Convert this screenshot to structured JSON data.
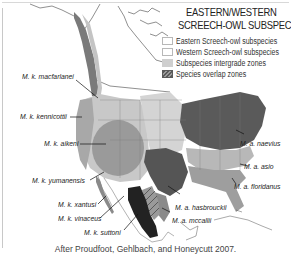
{
  "legend": {
    "title_line1": "EASTERN/WESTERN",
    "title_line2": "SCREECH-OWL SUBSPECIES",
    "items": [
      {
        "label": "Eastern Screech-owl subspecies",
        "type": "eastern"
      },
      {
        "label": "Western Screech-owl subspecies",
        "type": "western"
      },
      {
        "label": "Subspecies intergrade zones",
        "type": "intergrade"
      },
      {
        "label": "Species overlap zones",
        "type": "overlap"
      }
    ]
  },
  "western_labels": [
    {
      "text": "M. k. macfarlanei"
    },
    {
      "text": "M. k. kennicottii"
    },
    {
      "text": "M. k. aikeni"
    },
    {
      "text": "M. k. yumanensis"
    },
    {
      "text": "M. k. xantusi"
    },
    {
      "text": "M. k. vinaceus"
    },
    {
      "text": "M. k. suttoni"
    }
  ],
  "eastern_labels": [
    {
      "text": "M. a. naevius"
    },
    {
      "text": "M. a. asio"
    },
    {
      "text": "M. a. floridanus"
    },
    {
      "text": "M. a. hasbrouckii"
    },
    {
      "text": "M. a. mccallii"
    }
  ],
  "caption": "After Proudfoot, Gehlbach, and Honeycutt 2007.",
  "colors": {
    "kennicottii": "#a8a8a8",
    "macfarlanei": "#7a7a7a",
    "aikeni": "#9a9a9a",
    "intergrade": "#d4d4d4",
    "naevius": "#5a5a5a",
    "asio": "#b8b8b8",
    "floridanus": "#9e9e9e",
    "hasbrouckii": "#555555",
    "suttoni": "#222222",
    "mccallii": "#8a8a8a"
  }
}
